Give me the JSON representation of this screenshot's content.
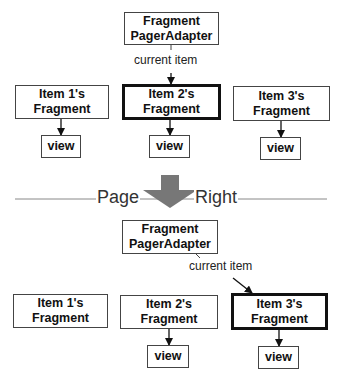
{
  "diagram": {
    "before": {
      "adapter": {
        "line1": "Fragment",
        "line2": "PagerAdapter"
      },
      "pointer_label": "current item",
      "items": [
        {
          "line1": "Item 1's",
          "line2": "Fragment",
          "view": "view",
          "current": false,
          "has_view": true
        },
        {
          "line1": "Item 2's",
          "line2": "Fragment",
          "view": "view",
          "current": true,
          "has_view": true
        },
        {
          "line1": "Item 3's",
          "line2": "Fragment",
          "view": "view",
          "current": false,
          "has_view": true
        }
      ]
    },
    "transition": {
      "left_label": "Page",
      "right_label": "Right",
      "arrow_color": "#777777"
    },
    "after": {
      "adapter": {
        "line1": "Fragment",
        "line2": "PagerAdapter"
      },
      "pointer_label": "current item",
      "items": [
        {
          "line1": "Item 1's",
          "line2": "Fragment",
          "current": false,
          "has_view": false
        },
        {
          "line1": "Item 2's",
          "line2": "Fragment",
          "view": "view",
          "current": false,
          "has_view": true
        },
        {
          "line1": "Item 3's",
          "line2": "Fragment",
          "view": "view",
          "current": true,
          "has_view": true
        }
      ]
    }
  }
}
